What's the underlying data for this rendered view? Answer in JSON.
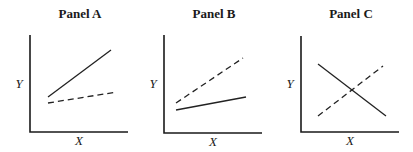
{
  "chart_data": [
    {
      "type": "line",
      "title": "Panel A",
      "xlabel": "X",
      "ylabel": "Y",
      "grid": false,
      "axes": {
        "x0": 30,
        "y0": 132,
        "x1": 128,
        "ytop": 35
      },
      "series": [
        {
          "name": "solid",
          "style": "solid",
          "points": [
            [
              48,
              97
            ],
            [
              111,
              50
            ]
          ]
        },
        {
          "name": "dashed",
          "style": "dashed",
          "points": [
            [
              48,
              103
            ],
            [
              117,
              92
            ]
          ]
        }
      ]
    },
    {
      "type": "line",
      "title": "Panel B",
      "xlabel": "X",
      "ylabel": "Y",
      "grid": false,
      "axes": {
        "x0": 164,
        "y0": 133,
        "x1": 262,
        "ytop": 35
      },
      "series": [
        {
          "name": "dashed",
          "style": "dashed",
          "points": [
            [
              176,
              103
            ],
            [
              243,
              58
            ]
          ]
        },
        {
          "name": "solid",
          "style": "solid",
          "points": [
            [
              176,
              110
            ],
            [
              246,
              97
            ]
          ]
        }
      ]
    },
    {
      "type": "line",
      "title": "Panel C",
      "xlabel": "X",
      "ylabel": "Y",
      "grid": false,
      "axes": {
        "x0": 301,
        "y0": 132,
        "x1": 399,
        "ytop": 36
      },
      "series": [
        {
          "name": "solid",
          "style": "solid",
          "points": [
            [
              318,
              64
            ],
            [
              386,
              116
            ]
          ]
        },
        {
          "name": "dashed",
          "style": "dashed",
          "points": [
            [
              318,
              116
            ],
            [
              383,
              66
            ]
          ]
        }
      ]
    }
  ]
}
